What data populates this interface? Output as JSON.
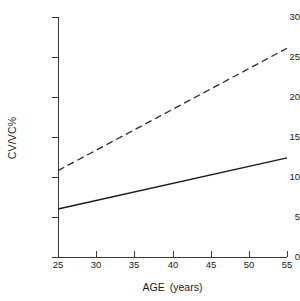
{
  "chart_data": {
    "type": "line",
    "title": "",
    "subtitle": "",
    "xlabel": "AGE",
    "xlabel_unit": "(years)",
    "ylabel": "CV/VC%",
    "xlim": [
      25,
      55
    ],
    "ylim": [
      0,
      30
    ],
    "xticks": [
      25,
      30,
      35,
      40,
      45,
      50,
      55
    ],
    "yticks": [
      0,
      5,
      10,
      15,
      20,
      25,
      30
    ],
    "xtick_labels": [
      "25",
      "30",
      "35",
      "40",
      "45",
      "50",
      "55"
    ],
    "ytick_labels": [
      "0",
      "5",
      "10",
      "15",
      "20",
      "25",
      "30"
    ],
    "grid": false,
    "legend": "none",
    "annotations": [],
    "series": [
      {
        "name": "upper-dashed-line",
        "style": "dashed",
        "color": "#2b2b2b",
        "x": [
          25,
          55
        ],
        "values": [
          10.8,
          26.1
        ]
      },
      {
        "name": "lower-solid-line",
        "style": "solid",
        "color": "#1a1a1a",
        "x": [
          25,
          55
        ],
        "values": [
          6.0,
          12.4
        ]
      }
    ]
  }
}
